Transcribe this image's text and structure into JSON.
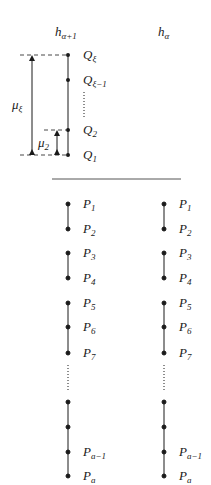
{
  "diagram": {
    "headers": {
      "left": {
        "base": "h",
        "sub": "α+1"
      },
      "right": {
        "base": "h",
        "sub": "α"
      }
    },
    "upper": {
      "points": [
        {
          "base": "Q",
          "sub": "ξ",
          "y": 55
        },
        {
          "base": "Q",
          "sub": "ξ−1",
          "y": 80
        },
        {
          "base": "Q",
          "sub": "2",
          "y": 130
        },
        {
          "base": "Q",
          "sub": "1",
          "y": 155
        }
      ],
      "measures": [
        {
          "base": "μ",
          "sub": "ξ"
        },
        {
          "base": "μ",
          "sub": "2"
        }
      ]
    },
    "lower": {
      "left_points": [
        {
          "base": "P",
          "sub": "1"
        },
        {
          "base": "P",
          "sub": "2"
        },
        {
          "base": "P",
          "sub": "3"
        },
        {
          "base": "P",
          "sub": "4"
        },
        {
          "base": "P",
          "sub": "5"
        },
        {
          "base": "P",
          "sub": "6"
        },
        {
          "base": "P",
          "sub": "7"
        },
        {
          "base": "P",
          "sub": "a−1"
        },
        {
          "base": "P",
          "sub": "a"
        }
      ],
      "right_points": [
        {
          "base": "P",
          "sub": "1"
        },
        {
          "base": "P",
          "sub": "2"
        },
        {
          "base": "P",
          "sub": "3"
        },
        {
          "base": "P",
          "sub": "4"
        },
        {
          "base": "P",
          "sub": "5"
        },
        {
          "base": "P",
          "sub": "6"
        },
        {
          "base": "P",
          "sub": "7"
        },
        {
          "base": "P",
          "sub": "a−1"
        },
        {
          "base": "P",
          "sub": "a"
        }
      ]
    },
    "colors": {
      "ink": "#1a1a1a",
      "rule": "#555555"
    }
  }
}
